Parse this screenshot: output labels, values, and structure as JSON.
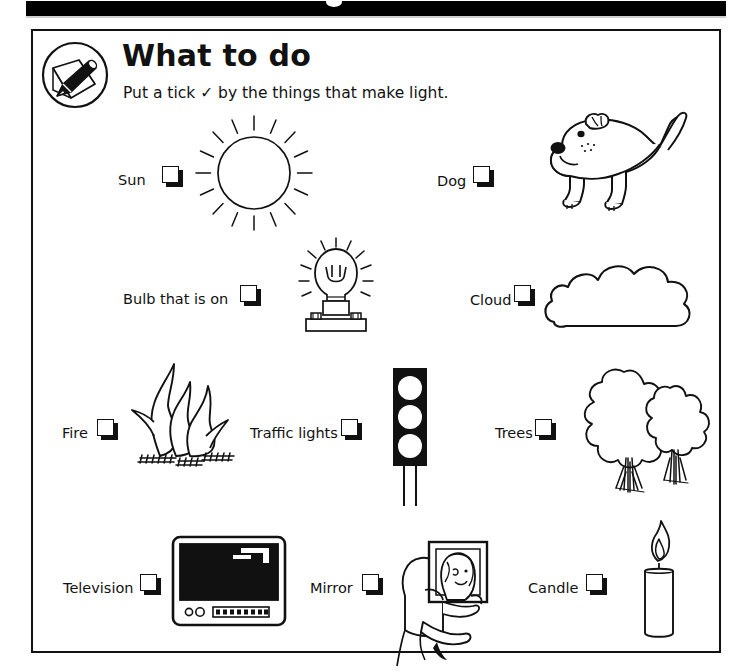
{
  "page": {
    "background_color": "#ffffff",
    "ink_color": "#111111",
    "top_band_color": "#000000"
  },
  "header": {
    "icon": "pencil-on-paper-icon",
    "title": "What to do",
    "instruction": "Put a tick ✓ by the things that make light.",
    "tick_symbol": "✓"
  },
  "worksheet": {
    "topic": "Things that make light",
    "checkbox_state": "unchecked",
    "rows": [
      {
        "row": 1,
        "items": [
          {
            "label": "Sun",
            "illustration": "sun-icon",
            "makes_light": true
          },
          {
            "label": "Dog",
            "illustration": "dog-icon",
            "makes_light": false
          }
        ]
      },
      {
        "row": 2,
        "items": [
          {
            "label": "Bulb that is on",
            "illustration": "light-bulb-icon",
            "makes_light": true
          },
          {
            "label": "Cloud",
            "illustration": "cloud-icon",
            "makes_light": false
          }
        ]
      },
      {
        "row": 3,
        "items": [
          {
            "label": "Fire",
            "illustration": "fire-icon",
            "makes_light": true
          },
          {
            "label": "Traffic lights",
            "illustration": "traffic-light-icon",
            "makes_light": true
          },
          {
            "label": "Trees",
            "illustration": "trees-icon",
            "makes_light": false
          }
        ]
      },
      {
        "row": 4,
        "items": [
          {
            "label": "Television",
            "illustration": "television-icon",
            "makes_light": true
          },
          {
            "label": "Mirror",
            "illustration": "person-with-mirror-icon",
            "makes_light": false
          },
          {
            "label": "Candle",
            "illustration": "candle-icon",
            "makes_light": true
          }
        ]
      }
    ]
  }
}
